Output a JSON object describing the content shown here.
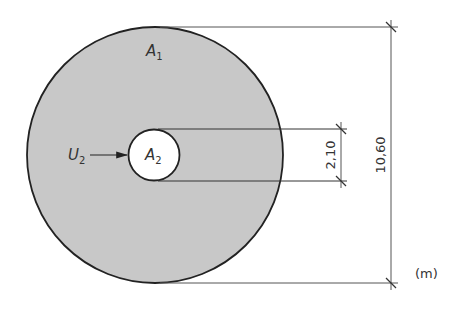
{
  "diagram": {
    "type": "annular-area",
    "unit_label": "(m)",
    "outer_circle": {
      "label": "A",
      "label_sub": "1",
      "diameter": "10,60",
      "fill": "#c8c8c8"
    },
    "inner_circle": {
      "label": "A",
      "label_sub": "2",
      "diameter": "2,10",
      "fill": "#ffffff"
    },
    "perimeter_pointer": {
      "label": "U",
      "label_sub": "2"
    },
    "dimensions": {
      "outer": "10,60",
      "inner": "2,10"
    },
    "colors": {
      "fill": "#c8c8c8",
      "stroke": "#222222",
      "line": "#555555"
    }
  }
}
